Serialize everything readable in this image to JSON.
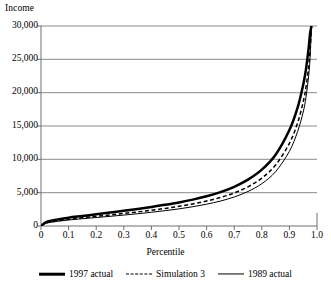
{
  "chart_data": {
    "type": "line",
    "title": "",
    "xlabel": "Percentile",
    "ylabel": "Income",
    "xlim": [
      0,
      1.0
    ],
    "ylim": [
      0,
      30000
    ],
    "grid": "horizontal",
    "legend_position": "bottom",
    "xticks": [
      "0",
      "0.1",
      "0.2",
      "0.3",
      "0.4",
      "0.5",
      "0.6",
      "0.7",
      "0.8",
      "0.9",
      "1.0"
    ],
    "xtick_values": [
      0,
      0.1,
      0.2,
      0.3,
      0.4,
      0.5,
      0.6,
      0.7,
      0.8,
      0.9,
      1.0
    ],
    "yticks": [
      "0",
      "5,000",
      "10,000",
      "15,000",
      "20,000",
      "25,000",
      "30,000"
    ],
    "ytick_values": [
      0,
      5000,
      10000,
      15000,
      20000,
      25000,
      30000
    ],
    "x": [
      0,
      0.02,
      0.05,
      0.1,
      0.15,
      0.2,
      0.25,
      0.3,
      0.35,
      0.4,
      0.45,
      0.5,
      0.55,
      0.6,
      0.65,
      0.7,
      0.75,
      0.8,
      0.85,
      0.9,
      0.93,
      0.95,
      0.96,
      0.97,
      0.975,
      0.98
    ],
    "series": [
      {
        "name": "1997 actual",
        "style": "thick-solid",
        "color": "#000000",
        "values": [
          0,
          620,
          900,
          1250,
          1500,
          1760,
          2020,
          2280,
          2560,
          2860,
          3180,
          3540,
          3960,
          4460,
          5080,
          5880,
          6950,
          8450,
          10700,
          14400,
          17800,
          21200,
          23500,
          26800,
          28900,
          30000
        ]
      },
      {
        "name": "Simulation 3",
        "style": "dashed",
        "color": "#000000",
        "values": [
          0,
          480,
          720,
          1020,
          1240,
          1450,
          1660,
          1880,
          2110,
          2360,
          2640,
          2950,
          3310,
          3740,
          4270,
          4960,
          5880,
          7180,
          9150,
          12400,
          15500,
          18600,
          20800,
          24000,
          26500,
          30000
        ]
      },
      {
        "name": "1989 actual",
        "style": "thin-solid",
        "color": "#000000",
        "values": [
          0,
          420,
          640,
          900,
          1090,
          1270,
          1450,
          1640,
          1840,
          2060,
          2300,
          2570,
          2890,
          3270,
          3740,
          4350,
          5180,
          6350,
          8150,
          11200,
          14200,
          17100,
          19300,
          22600,
          25300,
          30000
        ]
      }
    ]
  },
  "legend": {
    "items": [
      {
        "label": "1997 actual"
      },
      {
        "label": "Simulation 3"
      },
      {
        "label": "1989 actual"
      }
    ]
  }
}
